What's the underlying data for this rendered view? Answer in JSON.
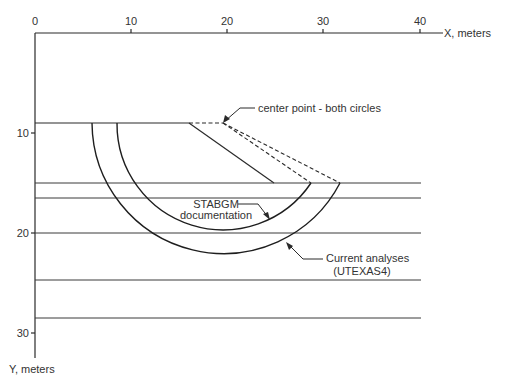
{
  "diagram": {
    "x_axis": {
      "label": "X, meters",
      "ticks": [
        {
          "value": "0",
          "x": 35
        },
        {
          "value": "10",
          "x": 131
        },
        {
          "value": "20",
          "x": 227
        },
        {
          "value": "30",
          "x": 323
        },
        {
          "value": "40",
          "x": 420
        }
      ]
    },
    "y_axis": {
      "label": "Y, meters",
      "ticks": [
        {
          "value": "10",
          "y": 133
        },
        {
          "value": "20",
          "y": 233
        },
        {
          "value": "30",
          "y": 333
        }
      ]
    },
    "annotations": {
      "center_point": "center point - both circles",
      "stabgm_line1": "STABGM",
      "stabgm_line2": "documentation",
      "current_line1": "Current analyses",
      "current_line2": "(UTEXAS4)"
    },
    "geometry": {
      "slope_crest": {
        "x_m": 16,
        "y_m": 9
      },
      "slope_toe": {
        "x_m": 25,
        "y_m": 15
      },
      "center_point": {
        "x_m": 19.5,
        "y_m": 9
      },
      "layer_boundaries_y_m": [
        15,
        16.5,
        20,
        24.7,
        28.5
      ],
      "circles": [
        {
          "name": "STABGM documentation",
          "radius_m": 11
        },
        {
          "name": "Current analyses (UTEXAS4)",
          "radius_m": 13.7
        }
      ]
    }
  }
}
